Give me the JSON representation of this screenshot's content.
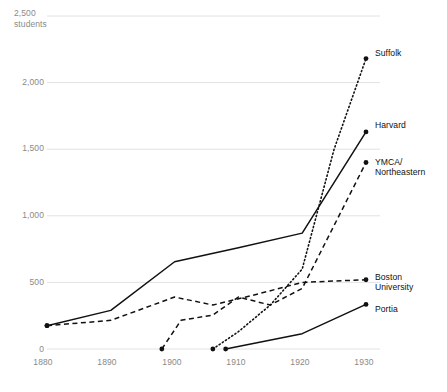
{
  "chart_data": {
    "type": "line",
    "title": "",
    "xlabel": "",
    "ylabel": "students",
    "y_unit_label": "2,500\nstudents",
    "xlim": [
      1878,
      1932
    ],
    "ylim": [
      0,
      2500
    ],
    "grid": true,
    "legend_position": "right-inline-labels",
    "x_ticks": [
      "1880",
      "1890",
      "1900",
      "1910",
      "1920",
      "1930"
    ],
    "x_tick_values": [
      1880,
      1890,
      1900,
      1910,
      1920,
      1930
    ],
    "y_ticks": [
      "0",
      "500",
      "1,000",
      "1,500",
      "2,000",
      "2,500"
    ],
    "y_tick_values": [
      0,
      500,
      1000,
      1500,
      2000,
      2500
    ],
    "series": [
      {
        "name": "Suffolk",
        "style": "dotted",
        "color": "#111111",
        "points": [
          {
            "x": 1906,
            "y": 0
          },
          {
            "x": 1910,
            "y": 130
          },
          {
            "x": 1915,
            "y": 330
          },
          {
            "x": 1920,
            "y": 600
          },
          {
            "x": 1925,
            "y": 1500
          },
          {
            "x": 1930,
            "y": 2180
          }
        ]
      },
      {
        "name": "Harvard",
        "style": "solid",
        "color": "#111111",
        "points": [
          {
            "x": 1880,
            "y": 175
          },
          {
            "x": 1890,
            "y": 290
          },
          {
            "x": 1900,
            "y": 655
          },
          {
            "x": 1910,
            "y": 760
          },
          {
            "x": 1920,
            "y": 870
          },
          {
            "x": 1930,
            "y": 1630
          }
        ]
      },
      {
        "name": "YMCA/\nNortheastern",
        "style": "dashed",
        "color": "#111111",
        "points": [
          {
            "x": 1898,
            "y": 0
          },
          {
            "x": 1901,
            "y": 215
          },
          {
            "x": 1906,
            "y": 255
          },
          {
            "x": 1910,
            "y": 390
          },
          {
            "x": 1915,
            "y": 330
          },
          {
            "x": 1920,
            "y": 455
          },
          {
            "x": 1930,
            "y": 1400
          }
        ]
      },
      {
        "name": "Boston\nUniversity",
        "style": "dashed",
        "color": "#111111",
        "points": [
          {
            "x": 1880,
            "y": 175
          },
          {
            "x": 1890,
            "y": 215
          },
          {
            "x": 1900,
            "y": 390
          },
          {
            "x": 1906,
            "y": 330
          },
          {
            "x": 1912,
            "y": 400
          },
          {
            "x": 1920,
            "y": 500
          },
          {
            "x": 1930,
            "y": 520
          }
        ]
      },
      {
        "name": "Portia",
        "style": "solid",
        "color": "#111111",
        "points": [
          {
            "x": 1908,
            "y": 0
          },
          {
            "x": 1920,
            "y": 115
          },
          {
            "x": 1930,
            "y": 335
          }
        ]
      }
    ]
  },
  "labels": {
    "suffolk": "Suffolk",
    "harvard": "Harvard",
    "ymca": "YMCA/\nNortheastern",
    "bu": "Boston\nUniversity",
    "portia": "Portia",
    "y_unit": "2,500\nstudents",
    "y_2000": "2,000",
    "y_1500": "1,500",
    "y_1000": "1,000",
    "y_500": "500",
    "y_0": "0",
    "x_1880": "1880",
    "x_1890": "1890",
    "x_1900": "1900",
    "x_1910": "1910",
    "x_1920": "1920",
    "x_1930": "1930"
  },
  "colors": {
    "line": "#111111",
    "grid": "#e2e2e2",
    "tick_text": "#8a8a8a",
    "label_text": "#111111",
    "background": "#ffffff"
  }
}
